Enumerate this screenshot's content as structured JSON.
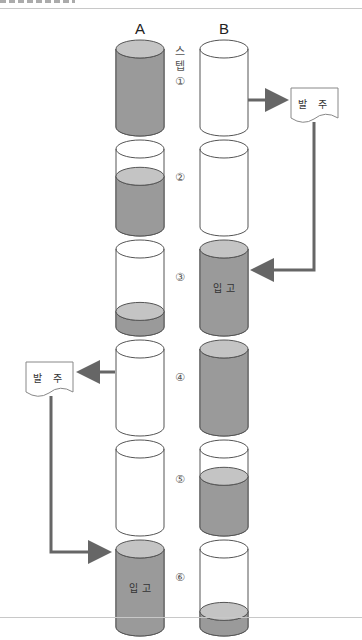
{
  "header": {
    "partially_visible_title": true
  },
  "columns": [
    {
      "label": "A"
    },
    {
      "label": "B"
    }
  ],
  "step_header": [
    "스",
    "텝"
  ],
  "steps": [
    {
      "marker": "①",
      "a_level": 1.0,
      "b_level": 0.0
    },
    {
      "marker": "②",
      "a_level": 0.65,
      "b_level": 0.0
    },
    {
      "marker": "③",
      "a_level": 0.2,
      "b_level": 1.0,
      "b_label": "입 고"
    },
    {
      "marker": "④",
      "a_level": 0.0,
      "b_level": 1.0
    },
    {
      "marker": "⑤",
      "a_level": 0.0,
      "b_level": 0.65
    },
    {
      "marker": "⑥",
      "a_level": 1.0,
      "b_level": 0.2,
      "a_label": "입 고"
    }
  ],
  "documents": {
    "right_order": {
      "label": "발 주"
    },
    "left_order": {
      "label": "발 주"
    }
  },
  "colors": {
    "fill": "#9a9a9a",
    "fill_top": "#c4c4c4",
    "stroke": "#555555",
    "arrow": "#666666",
    "rule": "#c8c8c8"
  }
}
